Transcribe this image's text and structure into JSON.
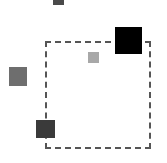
{
  "canvas": {
    "width": 167,
    "height": 163,
    "background": "#ffffff"
  },
  "selection_box": {
    "x": 45,
    "y": 41,
    "width": 106,
    "height": 108,
    "stroke": "#555555",
    "style": "dashed"
  },
  "squares": [
    {
      "name": "top-square",
      "x": 53,
      "y": -6,
      "width": 11,
      "height": 11,
      "color": "#4a4a4a"
    },
    {
      "name": "black-square",
      "x": 115,
      "y": 27,
      "width": 27,
      "height": 27,
      "color": "#000000"
    },
    {
      "name": "light-square",
      "x": 88,
      "y": 52,
      "width": 11,
      "height": 11,
      "color": "#a8a8a8"
    },
    {
      "name": "left-square",
      "x": 9,
      "y": 67,
      "width": 18,
      "height": 19,
      "color": "#6e6e6e"
    },
    {
      "name": "bottom-left-square",
      "x": 36,
      "y": 120,
      "width": 19,
      "height": 18,
      "color": "#3a3a3a"
    }
  ]
}
